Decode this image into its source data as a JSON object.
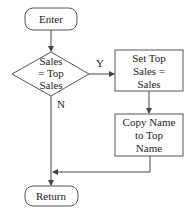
{
  "diagram": {
    "type": "flowchart",
    "nodes": {
      "enter": {
        "label": "Enter",
        "shape": "rounded-rect"
      },
      "decision": {
        "line1": "Sales",
        "line2": "= Top",
        "line3": "Sales",
        "shape": "diamond"
      },
      "set_top": {
        "line1": "Set Top",
        "line2": "Sales =",
        "line3": "Sales",
        "shape": "rect"
      },
      "copy_name": {
        "line1": "Copy Name",
        "line2": "to Top",
        "line3": "Name",
        "shape": "rect"
      },
      "return": {
        "label": "Return",
        "shape": "rounded-rect"
      }
    },
    "edges": {
      "yes_label": "Y",
      "no_label": "N"
    },
    "colors": {
      "stroke": "#555555",
      "text": "#222222",
      "background": "#ffffff"
    }
  }
}
